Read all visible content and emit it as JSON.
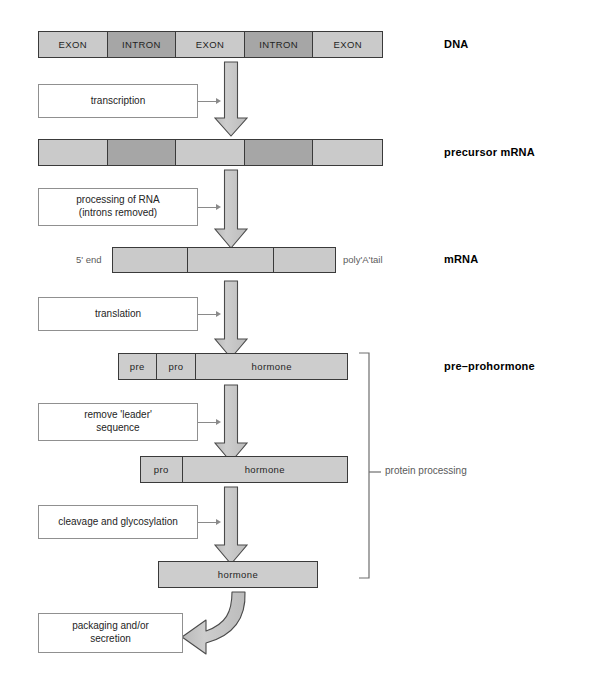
{
  "diagram": {
    "colors": {
      "exon": "#cacaca",
      "intron": "#a6a6a6",
      "bar_outline": "#3a3a3a",
      "arrow_fill": "#c4c4c4",
      "arrow_outline": "#4a4a4a",
      "process_box_outline": "#909090",
      "connector": "#8a8a8a",
      "bracket": "#6e6e6e",
      "note_text": "#5a5a5a",
      "background": "#ffffff"
    }
  },
  "stages": [
    {
      "id": "dna",
      "label": "DNA",
      "segments": [
        {
          "label": "EXON",
          "kind": "exon"
        },
        {
          "label": "INTRON",
          "kind": "intron"
        },
        {
          "label": "EXON",
          "kind": "exon"
        },
        {
          "label": "INTRON",
          "kind": "intron"
        },
        {
          "label": "EXON",
          "kind": "exon"
        }
      ]
    },
    {
      "id": "precursor-mrna",
      "label": "precursor mRNA",
      "segments": [
        {
          "label": "",
          "kind": "exon"
        },
        {
          "label": "",
          "kind": "intron"
        },
        {
          "label": "",
          "kind": "exon"
        },
        {
          "label": "",
          "kind": "intron"
        },
        {
          "label": "",
          "kind": "exon"
        }
      ]
    },
    {
      "id": "mrna",
      "label": "mRNA",
      "left_note": "5' end",
      "right_note": "poly'A'tail",
      "segments": [
        {
          "label": "",
          "kind": "light"
        },
        {
          "label": "",
          "kind": "light"
        },
        {
          "label": "",
          "kind": "light"
        }
      ]
    },
    {
      "id": "pre-prohormone",
      "label": "pre–prohormone",
      "segments": [
        {
          "label": "pre",
          "kind": "plain"
        },
        {
          "label": "pro",
          "kind": "plain"
        },
        {
          "label": "hormone",
          "kind": "plain"
        }
      ]
    },
    {
      "id": "prohormone",
      "label": "",
      "segments": [
        {
          "label": "pro",
          "kind": "plain"
        },
        {
          "label": "hormone",
          "kind": "plain"
        }
      ]
    },
    {
      "id": "hormone",
      "label": "",
      "segments": [
        {
          "label": "hormone",
          "kind": "plain"
        }
      ]
    }
  ],
  "processes": [
    {
      "id": "transcription",
      "lines": [
        "transcription"
      ]
    },
    {
      "id": "rna-processing",
      "lines": [
        "processing of RNA",
        "(introns removed)"
      ]
    },
    {
      "id": "translation",
      "lines": [
        "translation"
      ]
    },
    {
      "id": "remove-leader",
      "lines": [
        "remove 'leader'",
        "sequence"
      ]
    },
    {
      "id": "cleavage",
      "lines": [
        "cleavage and glycosylation"
      ]
    },
    {
      "id": "packaging",
      "lines": [
        "packaging and/or",
        "secretion"
      ]
    }
  ],
  "bracket": {
    "label": "protein processing"
  }
}
